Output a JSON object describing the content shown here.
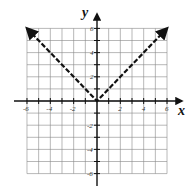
{
  "chart_data": {
    "type": "line",
    "title": "",
    "xlabel": "x",
    "ylabel": "y",
    "xlim": [
      -6,
      6
    ],
    "ylim": [
      -6,
      6
    ],
    "grid": true,
    "x_ticks": [
      -6,
      -4,
      -2,
      2,
      4,
      6
    ],
    "y_ticks": [
      -6,
      -4,
      -2,
      2,
      4,
      6
    ],
    "x_tick_labels": [
      "-6",
      "-4",
      "-2",
      "2",
      "4",
      "6"
    ],
    "y_tick_labels": [
      "6",
      "4",
      "2",
      "-2",
      "-4",
      "-6"
    ],
    "series": [
      {
        "name": "y = |x|",
        "style": "dashed with arrows at both ends",
        "x": [
          -6,
          -4,
          -2,
          0,
          2,
          4,
          6
        ],
        "y": [
          6,
          4,
          2,
          0,
          2,
          4,
          6
        ]
      }
    ],
    "legend": null
  },
  "labels": {
    "x_axis": "x",
    "y_axis": "y",
    "x_ticks": [
      "-6",
      "-4",
      "-2",
      "2",
      "4",
      "6"
    ],
    "y_ticks": [
      "6",
      "4",
      "2",
      "-2",
      "-4",
      "-6"
    ]
  }
}
